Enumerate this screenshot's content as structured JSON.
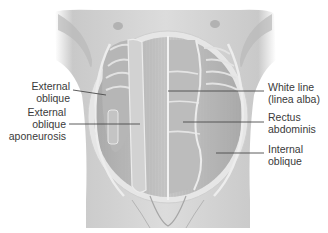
{
  "figure": {
    "style": "grayscale anatomical illustration",
    "colors": {
      "background": "#ffffff",
      "skin": "#d4d4d4",
      "skin_shadow": "#a9a9a9",
      "muscle": "#bdbdbd",
      "muscle_dark": "#9a9a9a",
      "sheath_highlight": "#eeeeee",
      "leader_line": "#4a4a4a",
      "label_text": "#3a3a3a"
    }
  },
  "labels": {
    "left": [
      {
        "id": "external-oblique",
        "lines": [
          "External",
          "oblique"
        ]
      },
      {
        "id": "external-oblique-aponeurosis",
        "lines": [
          "External",
          "oblique",
          "aponeurosis"
        ]
      }
    ],
    "right": [
      {
        "id": "white-line",
        "lines": [
          "White line",
          "(linea alba)"
        ]
      },
      {
        "id": "rectus-abdominis",
        "lines": [
          "Rectus",
          "abdominis"
        ]
      },
      {
        "id": "internal-oblique",
        "lines": [
          "Internal",
          "oblique"
        ]
      }
    ]
  }
}
